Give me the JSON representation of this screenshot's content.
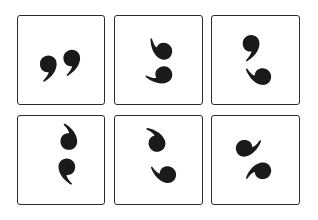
{
  "grid": {
    "rows": 2,
    "columns": 3,
    "border_color": "#2b2b2b",
    "glyph_color": "#1a1a1a",
    "background": "#ffffff",
    "tiles": [
      {
        "index": 0,
        "row": 0,
        "col": 0,
        "icon": "closing-double-quote-icon",
        "description": "two comma shapes side by side (closing quotation mark)"
      },
      {
        "index": 1,
        "row": 0,
        "col": 1,
        "icon": "comma-pair-rotated-icon",
        "description": "two comma shapes stacked, tails curving left"
      },
      {
        "index": 2,
        "row": 0,
        "col": 2,
        "icon": "comma-pair-vertical-icon",
        "description": "comma on top, inverted comma on bottom, tails curving together"
      },
      {
        "index": 3,
        "row": 1,
        "col": 0,
        "icon": "comma-pair-s-icon",
        "description": "inverted comma above a comma forming S-like shape"
      },
      {
        "index": 4,
        "row": 1,
        "col": 1,
        "icon": "comma-pair-reverse-s-icon",
        "description": "comma curving left above an inverted comma"
      },
      {
        "index": 5,
        "row": 1,
        "col": 2,
        "icon": "comma-pair-swirl-icon",
        "description": "two commas rotated forming a swirl"
      }
    ]
  }
}
